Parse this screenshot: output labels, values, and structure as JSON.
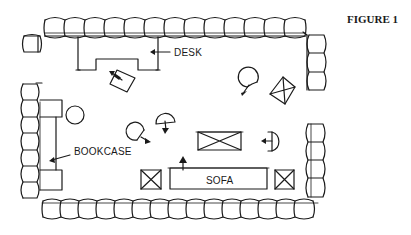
{
  "figure": {
    "title": "FIGURE 1"
  },
  "labels": {
    "desk": "DESK",
    "bookcase": "BOOKCASE",
    "sofa": "SOFA"
  },
  "diagram": {
    "type": "floor-plan-sketch",
    "elements": [
      {
        "name": "perimeter-seating-top",
        "count": 13
      },
      {
        "name": "perimeter-seating-right-upper",
        "count": 3
      },
      {
        "name": "perimeter-seating-right-lower",
        "count": 4
      },
      {
        "name": "perimeter-seating-left",
        "count": 7
      },
      {
        "name": "perimeter-seating-bottom",
        "count": 14
      },
      {
        "name": "separate-seat-top-left",
        "count": 1
      },
      {
        "name": "desk",
        "label": "DESK"
      },
      {
        "name": "desk-chair",
        "count": 1
      },
      {
        "name": "bookcase",
        "label": "BOOKCASE"
      },
      {
        "name": "sofa",
        "label": "SOFA"
      },
      {
        "name": "round-table",
        "count": 1
      },
      {
        "name": "swivel-chairs",
        "count": 5
      },
      {
        "name": "coffee-table",
        "count": 1
      },
      {
        "name": "end-tables",
        "count": 3
      }
    ],
    "colors": {
      "ink": "#1a1a1a",
      "background": "#ffffff"
    }
  }
}
